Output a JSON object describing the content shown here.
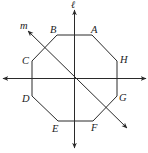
{
  "figure": {
    "lines": {
      "vertical": {
        "label": "ℓ"
      },
      "horizontal": {
        "label": ""
      },
      "diagonal": {
        "label": "m"
      }
    },
    "vertices": [
      {
        "name": "A",
        "label": "A"
      },
      {
        "name": "B",
        "label": "B"
      },
      {
        "name": "C",
        "label": "C"
      },
      {
        "name": "D",
        "label": "D"
      },
      {
        "name": "E",
        "label": "E"
      },
      {
        "name": "F",
        "label": "F"
      },
      {
        "name": "G",
        "label": "G"
      },
      {
        "name": "H",
        "label": "H"
      }
    ],
    "colors": {
      "stroke": "#2a2a2a",
      "text": "#222222",
      "background": "#ffffff"
    }
  }
}
